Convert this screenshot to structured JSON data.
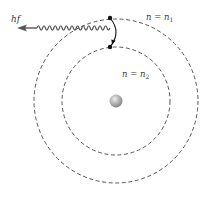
{
  "diagram": {
    "labels": {
      "photon": "hf",
      "outer_orbit": "n = n",
      "outer_orbit_sub": "1",
      "inner_orbit": "n = n",
      "inner_orbit_sub": "2"
    },
    "geometry": {
      "nucleus": {
        "cx": 116,
        "cy": 101,
        "r": 6
      },
      "outer_orbit": {
        "cx": 116,
        "cy": 101,
        "r": 82
      },
      "inner_orbit": {
        "cx": 116,
        "cy": 101,
        "r": 54
      },
      "electron_initial": {
        "x": 110,
        "y": 18
      },
      "electron_final": {
        "x": 110,
        "y": 47
      }
    },
    "colors": {
      "orbit": "#444444",
      "wave": "#555555",
      "electron": "#111111",
      "nucleus_light": "#e6e6e6",
      "nucleus_dark": "#8a8a8a"
    }
  }
}
